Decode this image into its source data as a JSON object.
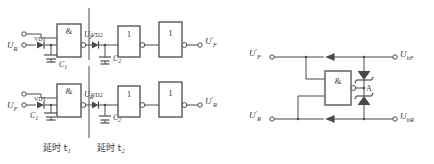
{
  "diagram": {
    "stroke_color": "#4a4a4a",
    "text_color": "#3a3a3a",
    "background": "#ffffff"
  },
  "left_circuit": {
    "name": "delay-circuit",
    "sections": [
      {
        "id": "t1",
        "label": "延时 t",
        "sub": "1"
      },
      {
        "id": "t2",
        "label": "延时 t",
        "sub": "2"
      }
    ],
    "rows": [
      {
        "id": "row-upper",
        "input_label": "U",
        "input_sub": "R",
        "diode1": "VD1",
        "cap1": "C",
        "cap1_sub": "1",
        "and_gate": "&",
        "mid_label": "U",
        "mid_sub": "F",
        "diode2": "VD2",
        "cap2": "C",
        "cap2_sub": "2",
        "inv1": "1",
        "inv2": "1",
        "output_label": "U",
        "output_sub": "F",
        "output_prime": "′"
      },
      {
        "id": "row-lower",
        "input_label": "U",
        "input_sub": "F",
        "diode1": "VD1",
        "cap1": "C",
        "cap1_sub": "1",
        "and_gate": "&",
        "mid_label": "U",
        "mid_sub": "R",
        "diode2": "VD2",
        "cap2": "C",
        "cap2_sub": "2",
        "inv1": "1",
        "inv2": "1",
        "output_label": "U",
        "output_sub": "R",
        "output_prime": "′"
      }
    ]
  },
  "right_circuit": {
    "name": "blocking-circuit",
    "and_gate": "&",
    "node_label": "A",
    "inputs": [
      {
        "id": "in-uf",
        "label": "U",
        "sub": "F",
        "prime": "′"
      },
      {
        "id": "in-ur",
        "label": "U",
        "sub": "R",
        "prime": "′"
      }
    ],
    "outputs": [
      {
        "id": "out-ubf",
        "label": "U",
        "sub": "bF"
      },
      {
        "id": "out-ubr",
        "label": "U",
        "sub": "bR"
      }
    ]
  }
}
